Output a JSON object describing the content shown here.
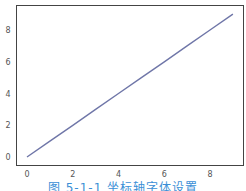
{
  "chart_data": {
    "type": "line",
    "title": "",
    "xlabel": "",
    "ylabel": "",
    "x": [
      0,
      1,
      2,
      3,
      4,
      5,
      6,
      7,
      8,
      9
    ],
    "series": [
      {
        "name": "y = x",
        "values": [
          0,
          1,
          2,
          3,
          4,
          5,
          6,
          7,
          8,
          9
        ],
        "color": "#6f76a8"
      }
    ],
    "xticks": [
      "0",
      "2",
      "4",
      "6",
      "8"
    ],
    "yticks": [
      "0",
      "2",
      "4",
      "6",
      "8"
    ],
    "xlim": [
      -0.45,
      9.45
    ],
    "ylim": [
      -0.45,
      9.45
    ],
    "grid": false,
    "legend": null
  },
  "caption": "图 5-1-1  坐标轴字体设置",
  "colors": {
    "line": "#6f76a8",
    "frame": "#444444",
    "caption": "#3b8fd6"
  }
}
